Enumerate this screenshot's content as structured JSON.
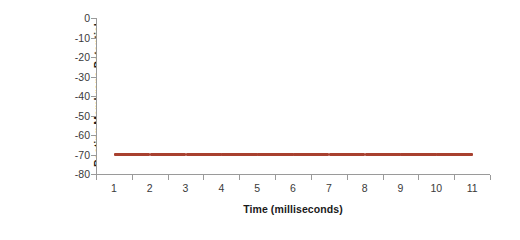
{
  "chart_data": {
    "type": "line",
    "title": "",
    "subtitle": "",
    "xlabel": "Time (milliseconds)",
    "ylabel_line1": "Resting Membrane Potential",
    "ylabel_line2": "(mVolts)",
    "ylabel": "Resting Membrane Potential (mVolts)",
    "categories": [
      1,
      2,
      3,
      4,
      5,
      6,
      7,
      8,
      9,
      10,
      11
    ],
    "x_tick_labels": [
      "1",
      "2",
      "3",
      "4",
      "5",
      "6",
      "7",
      "8",
      "9",
      "10",
      "11"
    ],
    "y_tick_labels": [
      "0",
      "-10",
      "-20",
      "-30",
      "-40",
      "-50",
      "-60",
      "-70",
      "-80"
    ],
    "y_tick_values": [
      0,
      -10,
      -20,
      -30,
      -40,
      -50,
      -60,
      -70,
      -80
    ],
    "ylim": [
      -80,
      0
    ],
    "xlim": [
      1,
      11
    ],
    "grid": false,
    "legend": false,
    "legend_position": "none",
    "series": [
      {
        "name": "Resting Membrane Potential",
        "color": "#a8402f",
        "values": [
          -70,
          -70,
          -70,
          -70,
          -70,
          -70,
          -70,
          -70,
          -70,
          -70,
          -70
        ]
      }
    ]
  },
  "colors": {
    "series_line": "#a8402f",
    "axis": "#9a9a9a",
    "tick_label": "#3a3a3a",
    "axis_title": "#1a1a1a",
    "background": "#ffffff"
  }
}
